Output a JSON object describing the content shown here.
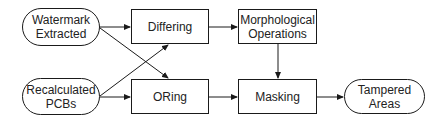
{
  "diagram": {
    "nodes": [
      {
        "id": "watermark_extracted",
        "shape": "terminal",
        "label": "Watermark\nExtracted"
      },
      {
        "id": "recalculated_pcbs",
        "shape": "terminal",
        "label": "Recalculated\nPCBs"
      },
      {
        "id": "differing",
        "shape": "process",
        "label": "Differing"
      },
      {
        "id": "oring",
        "shape": "process",
        "label": "ORing"
      },
      {
        "id": "morphological_operations",
        "shape": "process",
        "label": "Morphological\nOperations"
      },
      {
        "id": "masking",
        "shape": "process",
        "label": "Masking"
      },
      {
        "id": "tampered_areas",
        "shape": "terminal",
        "label": "Tampered\nAreas"
      }
    ],
    "edges": [
      {
        "from": "watermark_extracted",
        "to": "differing"
      },
      {
        "from": "watermark_extracted",
        "to": "oring"
      },
      {
        "from": "recalculated_pcbs",
        "to": "differing"
      },
      {
        "from": "recalculated_pcbs",
        "to": "oring"
      },
      {
        "from": "differing",
        "to": "morphological_operations"
      },
      {
        "from": "morphological_operations",
        "to": "masking"
      },
      {
        "from": "oring",
        "to": "masking"
      },
      {
        "from": "masking",
        "to": "tampered_areas"
      }
    ],
    "colors": {
      "stroke": "#1a1a1a",
      "fill": "#ffffff",
      "text": "#222222"
    }
  }
}
